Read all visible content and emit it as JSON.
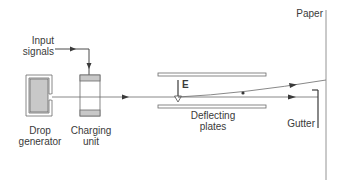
{
  "diagram": {
    "labels": {
      "input_signals_line1": "Input",
      "input_signals_line2": "signals",
      "drop_generator_line1": "Drop",
      "drop_generator_line2": "generator",
      "charging_unit_line1": "Charging",
      "charging_unit_line2": "unit",
      "field": "E",
      "deflecting_plates_line1": "Deflecting",
      "deflecting_plates_line2": "plates",
      "paper": "Paper",
      "gutter": "Gutter"
    },
    "components": [
      {
        "id": "drop-generator",
        "label": "Drop generator"
      },
      {
        "id": "charging-unit",
        "label": "Charging unit"
      },
      {
        "id": "deflecting-plates",
        "label": "Deflecting plates"
      },
      {
        "id": "paper",
        "label": "Paper"
      },
      {
        "id": "gutter",
        "label": "Gutter"
      }
    ],
    "flows": [
      {
        "from": "Input signals",
        "to": "Charging unit"
      },
      {
        "from": "Drop generator",
        "to": "Deflecting plates",
        "via": "Charging unit"
      },
      {
        "from": "Deflecting plates",
        "to": "Paper",
        "note": "charged drops deflected"
      },
      {
        "from": "Deflecting plates",
        "to": "Gutter",
        "note": "uncharged drops go straight"
      }
    ],
    "colors": {
      "line": "#4a4a4a",
      "fill_gray": "#c8c8c8",
      "outline": "#6a6a6a",
      "text": "#3a3a3a"
    }
  }
}
